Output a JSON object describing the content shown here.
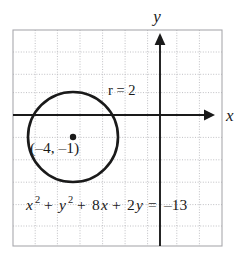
{
  "figure": {
    "background_color": "#ffffff",
    "grid": {
      "color": "#b9b9bd",
      "border_color": "#a9a9ae",
      "style": "dotted",
      "spacing_px": 22.5,
      "left_px": 13,
      "top_px": 30,
      "right_px": 222,
      "bottom_px": 246,
      "columns": 9,
      "rows": 9
    },
    "axes": {
      "color": "#1a1a1a",
      "origin_px": [
        160,
        115
      ],
      "x_axis_label": "x",
      "y_axis_label": "y",
      "x_arrow": "right",
      "y_arrow": "up"
    },
    "circle": {
      "color": "#1a1a1a",
      "center_label": "(–4, –1)",
      "radius_label": "r = 2",
      "radius_value": 2,
      "center_x": -4,
      "center_y": -1,
      "center_px": [
        73,
        137
      ],
      "radius_px": 45,
      "stroke_width": 2.6,
      "center_dot_radius_px": 3.2
    },
    "equation": {
      "full": "x² + y² + 8x + 2y = –13",
      "term_x": "x",
      "term_x_exp": "2",
      "plus_1": "+",
      "term_y": "y",
      "term_y_exp": "2",
      "plus_2": "+",
      "term_8x_coeff": "8",
      "term_8x_var": "x",
      "plus_3": "+",
      "term_2y_coeff": "2",
      "term_2y_var": "y",
      "equals": "=",
      "rhs": "–13"
    }
  }
}
